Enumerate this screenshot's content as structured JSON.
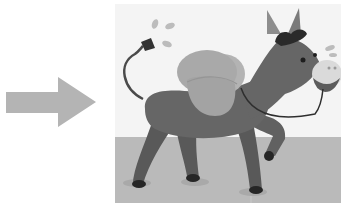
{
  "scene": {
    "arrow": {
      "direction": "right",
      "color": "#b4b4b4",
      "icon": "arrow-right-icon"
    },
    "illustration": {
      "subject": "donkey carrying packs",
      "background_color": "#f4f4f4",
      "floor_color": "#b9b9b9",
      "body_color": "#616161",
      "pack_color": "#a9a9a9"
    }
  }
}
